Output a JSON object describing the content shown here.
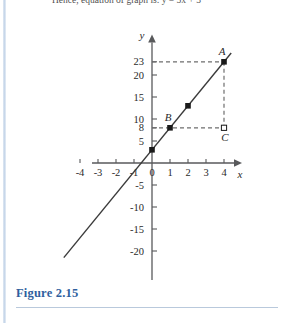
{
  "page": {
    "top_text": "Hence, equation of graph is: y = 5x + 3",
    "figure_label": "Figure 2.15"
  },
  "chart_data": {
    "type": "line",
    "title": "",
    "xlabel": "x",
    "ylabel": "y",
    "xlim": [
      -5,
      5
    ],
    "ylim": [
      -22,
      26
    ],
    "grid": false,
    "legend": null,
    "equation": "y = 5x + 3",
    "slope": 5,
    "intercept": 3,
    "x_ticks": [
      -4,
      -3,
      -2,
      -1,
      0,
      1,
      2,
      3,
      4
    ],
    "x_tick_labels": [
      "-4",
      "-3",
      "-2",
      "-1",
      "0",
      "1",
      "2",
      "3",
      "4"
    ],
    "y_ticks": [
      -20,
      -15,
      -10,
      -5,
      5,
      8,
      10,
      15,
      20,
      23
    ],
    "y_tick_labels": [
      "-20",
      "-15",
      "-10",
      "-5",
      "5",
      "8",
      "10",
      "15",
      "20",
      "23"
    ],
    "line_endpoints": [
      {
        "x": -4.9,
        "y": -21.5
      },
      {
        "x": 4.4,
        "y": 25.0
      }
    ],
    "points": [
      {
        "x": 0,
        "y": 3,
        "label": "",
        "marker": "filled-square"
      },
      {
        "x": 1,
        "y": 8,
        "label": "B",
        "marker": "filled-square"
      },
      {
        "x": 2,
        "y": 13,
        "label": "",
        "marker": "filled-square"
      },
      {
        "x": 4,
        "y": 23,
        "label": "A",
        "marker": "filled-square"
      },
      {
        "x": 4,
        "y": 8,
        "label": "C",
        "marker": "open-square"
      }
    ],
    "guide_lines": [
      {
        "from": {
          "x": 0,
          "y": 23
        },
        "to": {
          "x": 4,
          "y": 23
        },
        "style": "dashed"
      },
      {
        "from": {
          "x": 0,
          "y": 8
        },
        "to": {
          "x": 4,
          "y": 8
        },
        "style": "dashed"
      },
      {
        "from": {
          "x": 4,
          "y": 23
        },
        "to": {
          "x": 4,
          "y": 8
        },
        "style": "dashed"
      }
    ],
    "colors": {
      "axis": "#58595b",
      "line": "#3b3b3b",
      "marker": "#1a1a1a",
      "dashed": "#6e6e6e",
      "label": "#2f5f9e",
      "text": "#2a2a2a"
    }
  }
}
